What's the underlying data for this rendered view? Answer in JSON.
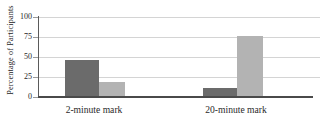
{
  "chart_data": {
    "type": "bar",
    "title": "",
    "xlabel": "",
    "ylabel": "Percentage of Participants",
    "categories": [
      "2-minute mark",
      "20-minute mark"
    ],
    "series": [
      {
        "name": "series-1",
        "values": [
          46,
          11
        ],
        "color": "#6b6b6b"
      },
      {
        "name": "series-2",
        "values": [
          19,
          76
        ],
        "color": "#b3b3b3"
      }
    ],
    "ylim": [
      0,
      100
    ],
    "yticks": [
      0,
      25,
      50,
      75,
      100
    ],
    "ytick_labels": [
      "0",
      "25",
      "50",
      "75",
      "100"
    ],
    "grid": true,
    "legend": false,
    "legend_position": "none",
    "axis_color": "#4a4a4a",
    "gridline_color": "#d4d4d4",
    "background": "#ffffff"
  },
  "axes": {
    "y_title": "Percentage of Participants"
  },
  "ticks": {
    "t0": "0",
    "t25": "25",
    "t50": "50",
    "t75": "75",
    "t100": "100"
  },
  "categories": {
    "c0": "2-minute mark",
    "c1": "20-minute mark"
  }
}
